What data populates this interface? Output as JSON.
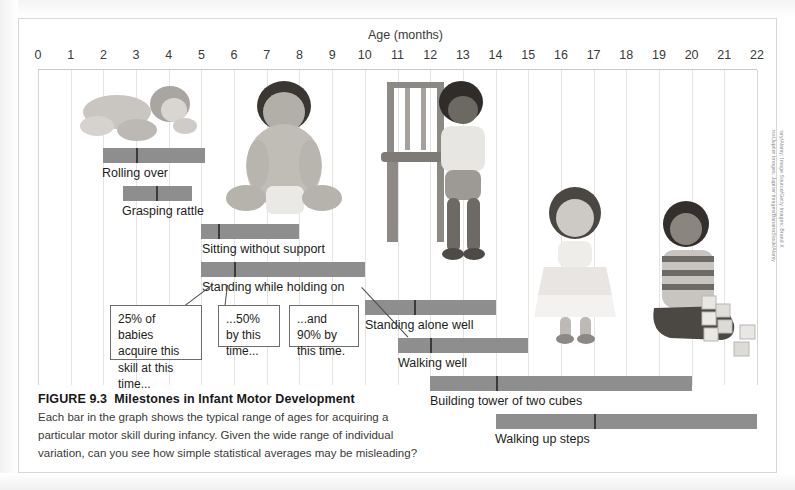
{
  "figure": {
    "axis_title": "Age (months)",
    "tick_labels": [
      "0",
      "1",
      "2",
      "3",
      "4",
      "5",
      "6",
      "7",
      "8",
      "9",
      "10",
      "11",
      "12",
      "13",
      "14",
      "15",
      "16",
      "17",
      "18",
      "19",
      "20",
      "21",
      "22"
    ],
    "caption_number": "FIGURE 9.3",
    "caption_title": "Milestones in Infant Motor Development",
    "caption_body": "Each bar in the graph shows the typical range of ages for acquiring a particular motor skill during infancy. Given the wide range of individual variation, can you see how simple statistical averages may be misleading?",
    "photo_credit": "(left to right) Bubbles Photolibrary/Alamy; Image Source/Getty Images; Brand X Pictures/Punchstock; Katie Moss/Jupiter Images; Jupiter Images/BananaStock/Alamy",
    "bar_color": "#8e8e8e",
    "tick_color": "#3b3b3b",
    "callouts": [
      {
        "id": "callout-25",
        "text": "25% of babies acquire this skill at this time..."
      },
      {
        "id": "callout-50",
        "text": "...50% by this time..."
      },
      {
        "id": "callout-90",
        "text": "...and 90% by this time."
      }
    ]
  },
  "chart_data": {
    "type": "bar",
    "orientation": "horizontal-range",
    "title": "Milestones in Infant Motor Development",
    "xlabel": "Age (months)",
    "ylabel": "",
    "xlim": [
      0,
      22
    ],
    "grid": true,
    "legend": "none",
    "note": "Each bar spans the 25th-to-90th percentile age range; the dark tick inside each bar marks the 50th percentile (median age).",
    "categories": [
      "Rolling over",
      "Grasping rattle",
      "Sitting without support",
      "Standing while holding on",
      "Standing alone well",
      "Walking well",
      "Building tower of two cubes",
      "Walking up steps"
    ],
    "bars": [
      {
        "label": "Rolling over",
        "start": 2.0,
        "end": 5.1,
        "median": 3.0
      },
      {
        "label": "Grasping rattle",
        "start": 2.6,
        "end": 4.7,
        "median": 3.6
      },
      {
        "label": "Sitting without support",
        "start": 5.0,
        "end": 8.0,
        "median": 5.5
      },
      {
        "label": "Standing while holding on",
        "start": 5.0,
        "end": 10.0,
        "median": 6.0
      },
      {
        "label": "Standing alone well",
        "start": 10.0,
        "end": 14.0,
        "median": 11.5
      },
      {
        "label": "Walking well",
        "start": 11.0,
        "end": 15.0,
        "median": 12.0
      },
      {
        "label": "Building tower of two cubes",
        "start": 12.0,
        "end": 20.0,
        "median": 14.0
      },
      {
        "label": "Walking up steps",
        "start": 14.0,
        "end": 22.0,
        "median": 17.0
      }
    ]
  }
}
